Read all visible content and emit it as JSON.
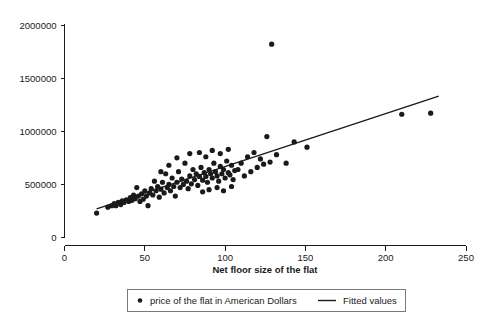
{
  "chart_data": {
    "type": "scatter",
    "title": "",
    "xlabel": "Net floor size of the flat",
    "ylabel": "",
    "xlim": [
      0,
      250
    ],
    "ylim": [
      0,
      2000000
    ],
    "xticks": [
      0,
      50,
      100,
      150,
      200,
      250
    ],
    "yticks": [
      0,
      500000,
      1000000,
      1500000,
      2000000
    ],
    "xtick_labels": [
      "0",
      "50",
      "100",
      "150",
      "200",
      "250"
    ],
    "ytick_labels": [
      "0",
      "500000",
      "1000000",
      "1500000",
      "2000000"
    ],
    "grid": false,
    "legend_position": "bottom",
    "point_color": "#1a1a1a",
    "line_color": "#1a1a1a",
    "series": [
      {
        "name": "price of the flat in American Dollars",
        "marker": "circle",
        "points": [
          [
            20.0,
            230000
          ],
          [
            27.0,
            285000
          ],
          [
            29.5,
            300000
          ],
          [
            31.0,
            320000
          ],
          [
            32.0,
            300000
          ],
          [
            33.5,
            330000
          ],
          [
            35.0,
            310000
          ],
          [
            36.0,
            345000
          ],
          [
            37.0,
            330000
          ],
          [
            38.5,
            355000
          ],
          [
            40.0,
            340000
          ],
          [
            41.0,
            375000
          ],
          [
            42.0,
            350000
          ],
          [
            43.0,
            400000
          ],
          [
            44.0,
            365000
          ],
          [
            45.0,
            470000
          ],
          [
            46.0,
            390000
          ],
          [
            47.0,
            340000
          ],
          [
            48.0,
            410000
          ],
          [
            49.0,
            360000
          ],
          [
            50.0,
            440000
          ],
          [
            51.0,
            390000
          ],
          [
            52.0,
            300000
          ],
          [
            53.0,
            420000
          ],
          [
            54.0,
            460000
          ],
          [
            55.0,
            400000
          ],
          [
            56.0,
            530000
          ],
          [
            57.0,
            440000
          ],
          [
            58.0,
            480000
          ],
          [
            59.0,
            380000
          ],
          [
            60.0,
            455000
          ],
          [
            61.0,
            520000
          ],
          [
            62.0,
            420000
          ],
          [
            63.0,
            600000
          ],
          [
            64.0,
            470000
          ],
          [
            65.0,
            500000
          ],
          [
            66.0,
            440000
          ],
          [
            67.0,
            560000
          ],
          [
            68.0,
            480000
          ],
          [
            69.0,
            390000
          ],
          [
            70.0,
            520000
          ],
          [
            71.0,
            620000
          ],
          [
            72.0,
            470000
          ],
          [
            73.0,
            550000
          ],
          [
            74.0,
            500000
          ],
          [
            75.0,
            700000
          ],
          [
            76.0,
            530000
          ],
          [
            77.0,
            460000
          ],
          [
            78.0,
            580000
          ],
          [
            79.0,
            505000
          ],
          [
            80.0,
            640000
          ],
          [
            81.0,
            545000
          ],
          [
            82.0,
            600000
          ],
          [
            83.0,
            490000
          ],
          [
            84.0,
            575000
          ],
          [
            85.0,
            660000
          ],
          [
            86.0,
            540000
          ],
          [
            87.0,
            610000
          ],
          [
            88.0,
            575000
          ],
          [
            89.0,
            520000
          ],
          [
            90.0,
            640000
          ],
          [
            91.0,
            600000
          ],
          [
            92.0,
            560000
          ],
          [
            93.0,
            700000
          ],
          [
            94.0,
            620000
          ],
          [
            95.0,
            580000
          ],
          [
            96.0,
            530000
          ],
          [
            97.0,
            670000
          ],
          [
            98.0,
            600000
          ],
          [
            99.0,
            640000
          ],
          [
            100.0,
            560000
          ],
          [
            101.0,
            720000
          ],
          [
            102.0,
            610000
          ],
          [
            103.0,
            590000
          ],
          [
            104.0,
            680000
          ],
          [
            105.0,
            545000
          ],
          [
            106.0,
            630000
          ],
          [
            60.0,
            620000
          ],
          [
            65.0,
            680000
          ],
          [
            70.0,
            750000
          ],
          [
            78.0,
            790000
          ],
          [
            84.0,
            800000
          ],
          [
            88.0,
            760000
          ],
          [
            92.0,
            820000
          ],
          [
            97.0,
            790000
          ],
          [
            102.0,
            830000
          ],
          [
            86.0,
            430000
          ],
          [
            90.0,
            450000
          ],
          [
            95.0,
            470000
          ],
          [
            99.0,
            440000
          ],
          [
            104.0,
            480000
          ],
          [
            108.0,
            640000
          ],
          [
            110.0,
            700000
          ],
          [
            112.0,
            580000
          ],
          [
            114.0,
            760000
          ],
          [
            116.0,
            620000
          ],
          [
            118.0,
            800000
          ],
          [
            120.0,
            660000
          ],
          [
            122.0,
            740000
          ],
          [
            124.0,
            690000
          ],
          [
            126.0,
            950000
          ],
          [
            128.0,
            710000
          ],
          [
            129.0,
            1820000
          ],
          [
            132.0,
            780000
          ],
          [
            138.0,
            700000
          ],
          [
            143.0,
            900000
          ],
          [
            151.0,
            850000
          ],
          [
            210.0,
            1160000
          ],
          [
            228.0,
            1170000
          ]
        ]
      }
    ],
    "fit": {
      "name": "Fitted values",
      "x_start": 20.0,
      "y_start": 270000,
      "x_end": 233.0,
      "y_end": 1330000
    }
  },
  "legend": {
    "point_label": "price of the flat in American Dollars",
    "line_label": "Fitted values"
  },
  "axis": {
    "x_title": "Net floor size of the flat"
  }
}
